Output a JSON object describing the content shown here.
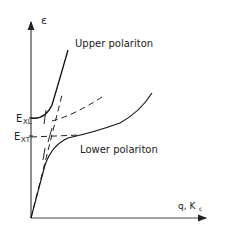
{
  "diagram": {
    "y_axis": {
      "label": "ε"
    },
    "x_axis": {
      "label": "q, K",
      "label_sub": "c"
    },
    "levels": [
      {
        "label": "E",
        "sub": "XL"
      },
      {
        "label": "E",
        "sub": "XT"
      }
    ],
    "branches": {
      "upper": "Upper polariton",
      "lower": "Lower polariton"
    },
    "colors": {
      "stroke": "#222222",
      "background": "#ffffff"
    }
  }
}
